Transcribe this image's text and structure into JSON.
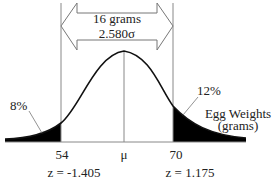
{
  "diagram": {
    "arrow": {
      "line1": "16 grams",
      "line2": "2.580σ"
    },
    "left_tail_label": "8%",
    "right_tail_label": "12%",
    "axis_label_line1": "Egg Weights",
    "axis_label_line2": "(grams)",
    "ticks": {
      "left": "54",
      "mean": "μ",
      "right": "70"
    },
    "z_values": {
      "left": "z = -1.405",
      "right": "z = 1.175"
    },
    "colors": {
      "curve": "#111111",
      "shade": "#000000",
      "lines": "#888888",
      "arrow": "#777777"
    }
  }
}
